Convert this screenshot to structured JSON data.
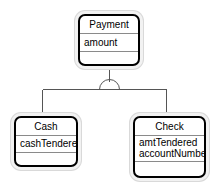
{
  "diagram": {
    "kind": "uml-class-diagram",
    "background_color": "#ffffff",
    "line_color": "#555555",
    "border_color": "#000000",
    "separator_color": "#8a8a8a",
    "shadow_color": "#d9d9d9",
    "relationship": {
      "name": "generalization",
      "marker": "arc",
      "parent": "Payment",
      "children": [
        "Cash",
        "Check"
      ]
    }
  },
  "classes": {
    "payment": {
      "name": "Payment",
      "attributes": [
        "amount"
      ],
      "operations": []
    },
    "cash": {
      "name": "Cash",
      "attributes": [
        "cashTendered"
      ],
      "operations": []
    },
    "check": {
      "name": "Check",
      "attributes": [
        "amtTendered",
        "accountNumber"
      ],
      "operations": []
    }
  }
}
